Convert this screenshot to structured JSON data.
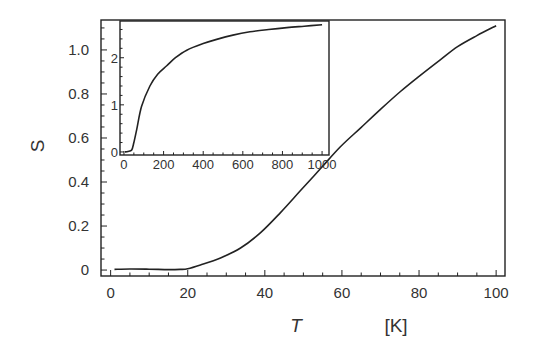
{
  "chart_data": [
    {
      "id": "main",
      "type": "line",
      "title": "",
      "xlabel": "T",
      "xunit": "[K]",
      "ylabel": "S",
      "xlim": [
        -2.5,
        102.3
      ],
      "ylim": [
        -0.027,
        1.136
      ],
      "xticks": [
        0,
        20,
        40,
        60,
        80,
        100
      ],
      "xtick_labels": [
        "0",
        "20",
        "40",
        "60",
        "80",
        "100"
      ],
      "x_minor_step": 5,
      "yticks": [
        0,
        0.2,
        0.4,
        0.6,
        0.8,
        1.0
      ],
      "ytick_labels": [
        "0",
        "0.2",
        "0.4",
        "0.6",
        "0.8",
        "1.0"
      ],
      "y_minor_step": 0.05,
      "grid": false,
      "series": [
        {
          "name": "S(T)",
          "color": "#222222",
          "x": [
            1,
            5,
            10,
            15,
            18,
            20,
            23.3,
            28.5,
            33.7,
            38.9,
            44,
            49.2,
            54.4,
            59.6,
            64.8,
            70,
            75.1,
            80,
            85.5,
            90,
            95,
            100
          ],
          "y": [
            0.003,
            0.005,
            0.004,
            0.002,
            0.003,
            0.006,
            0.023,
            0.055,
            0.1,
            0.17,
            0.26,
            0.36,
            0.46,
            0.56,
            0.645,
            0.73,
            0.81,
            0.88,
            0.955,
            1.015,
            1.065,
            1.11
          ]
        }
      ]
    },
    {
      "id": "inset",
      "type": "line",
      "title": "",
      "xlabel": "",
      "ylabel": "",
      "xlim": [
        -20,
        1035
      ],
      "ylim": [
        -0.065,
        2.78
      ],
      "xticks": [
        0,
        200,
        400,
        600,
        800,
        1000
      ],
      "xtick_labels": [
        "0",
        "200",
        "400",
        "600",
        "800",
        "1000"
      ],
      "x_minor_step": 50,
      "yticks": [
        0,
        1,
        2
      ],
      "ytick_labels": [
        "0",
        "1",
        "2"
      ],
      "y_minor_step": 0.2,
      "grid": false,
      "series": [
        {
          "name": "S(T) wide range",
          "color": "#222222",
          "x": [
            5,
            20,
            39,
            50,
            64,
            89,
            131,
            170,
            216,
            260,
            317,
            400,
            468,
            550,
            636,
            730,
            822,
            910,
            1000
          ],
          "y": [
            0.0,
            0.01,
            0.04,
            0.2,
            0.47,
            0.97,
            1.4,
            1.65,
            1.83,
            2.0,
            2.16,
            2.3,
            2.39,
            2.48,
            2.55,
            2.6,
            2.64,
            2.67,
            2.7
          ]
        }
      ]
    }
  ]
}
